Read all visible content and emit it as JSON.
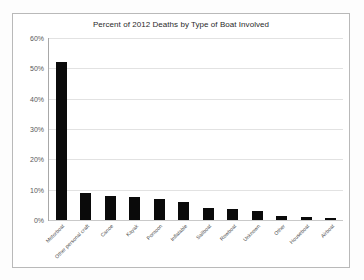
{
  "chart_data": {
    "type": "bar",
    "title": "Percent of 2012 Deaths by Type of Boat Involved",
    "xlabel": "",
    "ylabel": "",
    "ylim": [
      0,
      60
    ],
    "ytick_labels": [
      "60%",
      "50%",
      "40%",
      "30%",
      "20%",
      "10%",
      "0%"
    ],
    "ytick_values": [
      60,
      50,
      40,
      30,
      20,
      10,
      0
    ],
    "grid": true,
    "legend": false,
    "bar_color": "#0a0a0a",
    "categories": [
      "Motorboat",
      "Other personal craft",
      "Canoe",
      "Kayak",
      "Pontoon",
      "Inflatable",
      "Sailboat",
      "Rowboat",
      "Unknown",
      "Other",
      "Houseboat",
      "Airboat"
    ],
    "values": [
      52,
      9,
      8,
      7.5,
      7,
      6,
      4,
      3.5,
      3,
      1.2,
      1,
      0.5
    ]
  }
}
